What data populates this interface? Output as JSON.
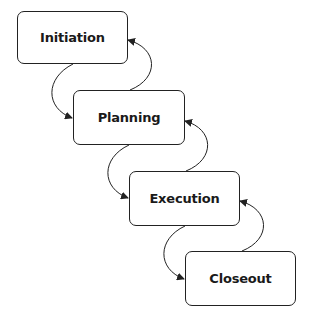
{
  "diagram": {
    "type": "waterfall",
    "stages": [
      {
        "label": "Initiation"
      },
      {
        "label": "Planning"
      },
      {
        "label": "Execution"
      },
      {
        "label": "Closeout"
      }
    ],
    "connections": [
      {
        "from": "Initiation",
        "to": "Planning",
        "direction": "forward"
      },
      {
        "from": "Planning",
        "to": "Initiation",
        "direction": "back"
      },
      {
        "from": "Planning",
        "to": "Execution",
        "direction": "forward"
      },
      {
        "from": "Execution",
        "to": "Planning",
        "direction": "back"
      },
      {
        "from": "Execution",
        "to": "Closeout",
        "direction": "forward"
      },
      {
        "from": "Closeout",
        "to": "Execution",
        "direction": "back"
      }
    ],
    "colors": {
      "stroke": "#222222",
      "fill": "#ffffff",
      "text": "#1a1a1a"
    }
  }
}
